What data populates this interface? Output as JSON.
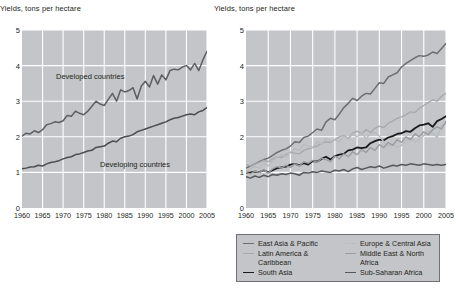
{
  "chart_data": [
    {
      "id": "left",
      "type": "line",
      "title": "Yields, tons per hectare",
      "xlabel": "",
      "ylabel": "",
      "xlim": [
        1960,
        2005
      ],
      "ylim": [
        0,
        5
      ],
      "grid": true,
      "xticks": [
        1960,
        1965,
        1970,
        1975,
        1980,
        1985,
        1990,
        1995,
        2000,
        2005
      ],
      "yticks": [
        0,
        1,
        2,
        3,
        4,
        5
      ],
      "legend_position": "inline-annotations",
      "annotations": [
        {
          "text": "Developed countries",
          "x": 1972,
          "y": 3.45
        },
        {
          "text": "Developing countries",
          "x": 1985,
          "y": 1.45
        }
      ],
      "x": [
        1960,
        1961,
        1962,
        1963,
        1964,
        1965,
        1966,
        1967,
        1968,
        1969,
        1970,
        1971,
        1972,
        1973,
        1974,
        1975,
        1976,
        1977,
        1978,
        1979,
        1980,
        1981,
        1982,
        1983,
        1984,
        1985,
        1986,
        1987,
        1988,
        1989,
        1990,
        1991,
        1992,
        1993,
        1994,
        1995,
        1996,
        1997,
        1998,
        1999,
        2000,
        2001,
        2002,
        2003,
        2004,
        2005
      ],
      "series": [
        {
          "name": "Developed countries",
          "color": "#5c5f63",
          "width": 1.5,
          "values": [
            2.02,
            2.1,
            2.08,
            2.17,
            2.12,
            2.2,
            2.34,
            2.37,
            2.42,
            2.4,
            2.45,
            2.6,
            2.58,
            2.72,
            2.66,
            2.62,
            2.72,
            2.86,
            3.0,
            2.92,
            2.88,
            3.05,
            3.22,
            3.0,
            3.32,
            3.26,
            3.3,
            3.38,
            3.06,
            3.42,
            3.56,
            3.4,
            3.72,
            3.48,
            3.74,
            3.6,
            3.86,
            3.9,
            3.88,
            3.96,
            4.0,
            3.88,
            4.06,
            3.86,
            4.16,
            4.4
          ]
        },
        {
          "name": "Developing countries",
          "color": "#4a4d51",
          "width": 1.5,
          "values": [
            1.1,
            1.12,
            1.15,
            1.16,
            1.2,
            1.18,
            1.24,
            1.28,
            1.3,
            1.33,
            1.38,
            1.42,
            1.44,
            1.5,
            1.52,
            1.56,
            1.6,
            1.62,
            1.7,
            1.72,
            1.74,
            1.82,
            1.88,
            1.86,
            1.96,
            2.0,
            2.02,
            2.06,
            2.14,
            2.18,
            2.22,
            2.26,
            2.3,
            2.34,
            2.38,
            2.42,
            2.48,
            2.52,
            2.54,
            2.58,
            2.62,
            2.64,
            2.62,
            2.7,
            2.74,
            2.82
          ]
        }
      ]
    },
    {
      "id": "right",
      "type": "line",
      "title": "Yields, tons per hectare",
      "xlabel": "",
      "ylabel": "",
      "xlim": [
        1960,
        2005
      ],
      "ylim": [
        0,
        5
      ],
      "grid": true,
      "xticks": [
        1960,
        1965,
        1970,
        1975,
        1980,
        1985,
        1990,
        1995,
        2000,
        2005
      ],
      "yticks": [
        0,
        1,
        2,
        3,
        4,
        5
      ],
      "legend_position": "below",
      "x": [
        1960,
        1961,
        1962,
        1963,
        1964,
        1965,
        1966,
        1967,
        1968,
        1969,
        1970,
        1971,
        1972,
        1973,
        1974,
        1975,
        1976,
        1977,
        1978,
        1979,
        1980,
        1981,
        1982,
        1983,
        1984,
        1985,
        1986,
        1987,
        1988,
        1989,
        1990,
        1991,
        1992,
        1993,
        1994,
        1995,
        1996,
        1997,
        1998,
        1999,
        2000,
        2001,
        2002,
        2003,
        2004,
        2005
      ],
      "series": [
        {
          "name": "East Asia & Pacific",
          "color": "#6b6e72",
          "width": 1.5,
          "values": [
            1.12,
            1.18,
            1.24,
            1.3,
            1.36,
            1.4,
            1.48,
            1.56,
            1.62,
            1.66,
            1.74,
            1.86,
            1.84,
            1.98,
            2.02,
            2.12,
            2.22,
            2.18,
            2.42,
            2.52,
            2.48,
            2.64,
            2.82,
            2.94,
            3.08,
            3.02,
            3.14,
            3.22,
            3.2,
            3.36,
            3.52,
            3.5,
            3.68,
            3.74,
            3.8,
            3.96,
            4.06,
            4.14,
            4.22,
            4.28,
            4.26,
            4.3,
            4.38,
            4.34,
            4.48,
            4.62
          ]
        },
        {
          "name": "Latin America & Caribbean",
          "color": "#a7aaad",
          "width": 1.4,
          "values": [
            1.22,
            1.18,
            1.24,
            1.28,
            1.34,
            1.3,
            1.38,
            1.44,
            1.42,
            1.5,
            1.56,
            1.54,
            1.52,
            1.62,
            1.66,
            1.7,
            1.74,
            1.82,
            1.86,
            1.84,
            1.92,
            2.0,
            2.04,
            1.96,
            2.1,
            2.16,
            2.08,
            2.2,
            2.12,
            2.24,
            2.3,
            2.26,
            2.38,
            2.44,
            2.52,
            2.56,
            2.62,
            2.7,
            2.68,
            2.8,
            2.88,
            2.96,
            3.04,
            3.0,
            3.14,
            3.22
          ]
        },
        {
          "name": "South Asia",
          "color": "#1a1a1a",
          "width": 1.8,
          "values": [
            0.99,
            1.0,
            1.02,
            1.01,
            1.06,
            1.0,
            1.06,
            1.12,
            1.14,
            1.16,
            1.22,
            1.24,
            1.2,
            1.26,
            1.22,
            1.32,
            1.3,
            1.38,
            1.44,
            1.36,
            1.46,
            1.5,
            1.52,
            1.62,
            1.64,
            1.7,
            1.68,
            1.7,
            1.82,
            1.88,
            1.92,
            1.9,
            1.98,
            2.02,
            2.08,
            2.1,
            2.16,
            2.14,
            2.24,
            2.32,
            2.34,
            2.38,
            2.28,
            2.44,
            2.5,
            2.58
          ]
        },
        {
          "name": "Europe & Central Asia",
          "color": "#b9bcbf",
          "width": 1.4,
          "values": [
            1.04,
            1.1,
            1.16,
            1.12,
            1.26,
            1.18,
            1.34,
            1.42,
            1.5,
            1.44,
            1.58,
            1.66,
            1.62,
            1.78,
            1.74,
            1.7,
            1.86,
            1.8,
            1.96,
            1.88,
            1.92,
            1.84,
            2.02,
            1.94,
            2.08,
            2.0,
            2.1,
            1.96,
            2.08,
            2.12,
            2.02,
            1.86,
            1.74,
            1.8,
            1.7,
            1.76,
            1.88,
            1.96,
            1.86,
            1.92,
            2.04,
            2.16,
            2.1,
            1.98,
            2.32,
            2.36
          ]
        },
        {
          "name": "Middle East & North Africa",
          "color": "#9a9da0",
          "width": 1.4,
          "values": [
            1.0,
            0.96,
            1.04,
            1.0,
            1.08,
            0.98,
            1.1,
            1.16,
            1.12,
            1.2,
            1.14,
            1.24,
            1.18,
            1.3,
            1.26,
            1.34,
            1.28,
            1.4,
            1.36,
            1.3,
            1.46,
            1.38,
            1.52,
            1.44,
            1.58,
            1.5,
            1.64,
            1.56,
            1.7,
            1.62,
            1.78,
            1.7,
            1.84,
            1.76,
            1.92,
            1.84,
            2.0,
            1.92,
            2.08,
            2.0,
            2.14,
            2.06,
            2.2,
            2.28,
            2.22,
            2.44
          ]
        },
        {
          "name": "Sub-Saharan Africa",
          "color": "#55585c",
          "width": 1.5,
          "values": [
            0.88,
            0.84,
            0.9,
            0.86,
            0.92,
            0.88,
            0.94,
            0.92,
            0.96,
            0.94,
            0.98,
            0.96,
            0.92,
            1.0,
            0.98,
            1.02,
            1.0,
            1.04,
            1.02,
            1.0,
            1.06,
            1.04,
            1.08,
            1.02,
            1.1,
            1.14,
            1.08,
            1.12,
            1.16,
            1.14,
            1.18,
            1.12,
            1.16,
            1.2,
            1.18,
            1.22,
            1.2,
            1.24,
            1.22,
            1.2,
            1.24,
            1.22,
            1.2,
            1.22,
            1.2,
            1.22
          ]
        }
      ]
    }
  ],
  "left_panel": {
    "title": "Yields, tons per hectare",
    "yticks": [
      "5",
      "4",
      "3",
      "2",
      "1",
      "0"
    ],
    "xticks": [
      "1960",
      "1965",
      "1970",
      "1975",
      "1980",
      "1985",
      "1990",
      "1995",
      "2000",
      "2005"
    ],
    "annotation_developed": "Developed countries",
    "annotation_developing": "Developing countries"
  },
  "right_panel": {
    "title": "Yields, tons per hectare",
    "yticks": [
      "5",
      "4",
      "3",
      "2",
      "1",
      "0"
    ],
    "xticks": [
      "1960",
      "1965",
      "1970",
      "1975",
      "1980",
      "1985",
      "1990",
      "1995",
      "2000",
      "2005"
    ]
  },
  "legend": {
    "columns": [
      [
        {
          "label": "East Asia & Pacific",
          "color": "#6b6e72"
        },
        {
          "label": "Latin America &\nCaribbean",
          "color": "#a7aaad"
        },
        {
          "label": "South Asia",
          "color": "#1a1a1a"
        }
      ],
      [
        {
          "label": "Europe & Central Asia",
          "color": "#b9bcbf"
        },
        {
          "label": "Middle East & North\nAfrica",
          "color": "#9a9da0"
        },
        {
          "label": "Sub-Saharan Africa",
          "color": "#55585c"
        }
      ]
    ]
  },
  "colors": {
    "plot_background": "#c3c5c8",
    "gridline": "#ffffff",
    "text": "#231f20",
    "legend_border": "#6f7174",
    "page_background": "#ffffff"
  }
}
